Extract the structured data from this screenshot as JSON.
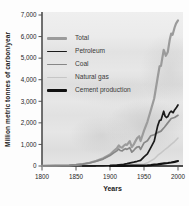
{
  "chart_data": {
    "type": "line",
    "title": "",
    "xlabel": "Years",
    "ylabel": "Million metric tonnes of carbon/year",
    "xlim": [
      1800,
      2000
    ],
    "ylim": [
      0,
      7000
    ],
    "grid": false,
    "legend_position": "top-left",
    "x_ticks": [
      {
        "value": 1800,
        "label": "1800"
      },
      {
        "value": 1850,
        "label": "1850"
      },
      {
        "value": 1900,
        "label": "1900"
      },
      {
        "value": 1950,
        "label": "1950"
      },
      {
        "value": 2000,
        "label": "2000"
      }
    ],
    "y_ticks": [
      {
        "value": 0,
        "label": "0"
      },
      {
        "value": 1000,
        "label": "1,000"
      },
      {
        "value": 2000,
        "label": "2,000"
      },
      {
        "value": 3000,
        "label": "3,000"
      },
      {
        "value": 4000,
        "label": "4,000"
      },
      {
        "value": 5000,
        "label": "5,000"
      },
      {
        "value": 6000,
        "label": "6,000"
      },
      {
        "value": 7000,
        "label": "7,000"
      }
    ],
    "series": [
      {
        "name": "Total",
        "color": "#9b9b9b",
        "width": 2.2,
        "points": [
          [
            1800,
            8
          ],
          [
            1810,
            12
          ],
          [
            1820,
            15
          ],
          [
            1830,
            25
          ],
          [
            1840,
            34
          ],
          [
            1850,
            55
          ],
          [
            1860,
            92
          ],
          [
            1870,
            148
          ],
          [
            1880,
            238
          ],
          [
            1890,
            356
          ],
          [
            1900,
            534
          ],
          [
            1905,
            680
          ],
          [
            1910,
            820
          ],
          [
            1913,
            950
          ],
          [
            1915,
            880
          ],
          [
            1918,
            850
          ],
          [
            1920,
            935
          ],
          [
            1923,
            1000
          ],
          [
            1925,
            980
          ],
          [
            1929,
            1150
          ],
          [
            1932,
            880
          ],
          [
            1935,
            1000
          ],
          [
            1937,
            1130
          ],
          [
            1940,
            1300
          ],
          [
            1943,
            1380
          ],
          [
            1945,
            1160
          ],
          [
            1950,
            1640
          ],
          [
            1955,
            2050
          ],
          [
            1960,
            2580
          ],
          [
            1965,
            3130
          ],
          [
            1970,
            4080
          ],
          [
            1973,
            4620
          ],
          [
            1975,
            4640
          ],
          [
            1979,
            5380
          ],
          [
            1980,
            5310
          ],
          [
            1982,
            5110
          ],
          [
            1985,
            5290
          ],
          [
            1988,
            5870
          ],
          [
            1990,
            6140
          ],
          [
            1992,
            6080
          ],
          [
            1995,
            6420
          ],
          [
            1997,
            6600
          ],
          [
            2000,
            6750
          ]
        ]
      },
      {
        "name": "Petroleum",
        "color": "#1a1a1a",
        "width": 1.7,
        "points": [
          [
            1860,
            1
          ],
          [
            1870,
            3
          ],
          [
            1880,
            6
          ],
          [
            1890,
            10
          ],
          [
            1900,
            16
          ],
          [
            1910,
            40
          ],
          [
            1920,
            78
          ],
          [
            1925,
            110
          ],
          [
            1930,
            150
          ],
          [
            1935,
            180
          ],
          [
            1940,
            220
          ],
          [
            1945,
            260
          ],
          [
            1950,
            425
          ],
          [
            1955,
            560
          ],
          [
            1960,
            850
          ],
          [
            1965,
            1150
          ],
          [
            1970,
            1850
          ],
          [
            1973,
            2120
          ],
          [
            1975,
            2130
          ],
          [
            1979,
            2540
          ],
          [
            1981,
            2310
          ],
          [
            1983,
            2250
          ],
          [
            1985,
            2290
          ],
          [
            1988,
            2480
          ],
          [
            1990,
            2540
          ],
          [
            1993,
            2470
          ],
          [
            1995,
            2600
          ],
          [
            1998,
            2720
          ],
          [
            2000,
            2830
          ]
        ]
      },
      {
        "name": "Coal",
        "color": "#868686",
        "width": 1.7,
        "points": [
          [
            1800,
            8
          ],
          [
            1810,
            11
          ],
          [
            1820,
            14
          ],
          [
            1830,
            24
          ],
          [
            1840,
            33
          ],
          [
            1850,
            54
          ],
          [
            1860,
            88
          ],
          [
            1870,
            140
          ],
          [
            1880,
            220
          ],
          [
            1890,
            320
          ],
          [
            1900,
            480
          ],
          [
            1905,
            600
          ],
          [
            1910,
            700
          ],
          [
            1913,
            790
          ],
          [
            1915,
            720
          ],
          [
            1918,
            700
          ],
          [
            1920,
            760
          ],
          [
            1923,
            800
          ],
          [
            1925,
            770
          ],
          [
            1929,
            850
          ],
          [
            1932,
            640
          ],
          [
            1935,
            730
          ],
          [
            1937,
            800
          ],
          [
            1940,
            880
          ],
          [
            1943,
            900
          ],
          [
            1945,
            770
          ],
          [
            1950,
            1070
          ],
          [
            1955,
            1170
          ],
          [
            1960,
            1400
          ],
          [
            1965,
            1450
          ],
          [
            1970,
            1550
          ],
          [
            1975,
            1620
          ],
          [
            1980,
            1800
          ],
          [
            1985,
            2000
          ],
          [
            1990,
            2200
          ],
          [
            1995,
            2250
          ],
          [
            2000,
            2350
          ]
        ]
      },
      {
        "name": "Natural gas",
        "color": "#c6c6c6",
        "width": 1.5,
        "points": [
          [
            1880,
            1
          ],
          [
            1890,
            3
          ],
          [
            1900,
            6
          ],
          [
            1910,
            14
          ],
          [
            1920,
            25
          ],
          [
            1930,
            50
          ],
          [
            1940,
            80
          ],
          [
            1950,
            97
          ],
          [
            1955,
            150
          ],
          [
            1960,
            235
          ],
          [
            1965,
            330
          ],
          [
            1970,
            493
          ],
          [
            1975,
            610
          ],
          [
            1980,
            740
          ],
          [
            1985,
            860
          ],
          [
            1990,
            1000
          ],
          [
            1995,
            1130
          ],
          [
            2000,
            1300
          ]
        ]
      },
      {
        "name": "Cement production",
        "color": "#111111",
        "width": 2.2,
        "points": [
          [
            1900,
            3
          ],
          [
            1910,
            6
          ],
          [
            1920,
            8
          ],
          [
            1930,
            12
          ],
          [
            1940,
            16
          ],
          [
            1950,
            18
          ],
          [
            1955,
            30
          ],
          [
            1960,
            43
          ],
          [
            1965,
            60
          ],
          [
            1970,
            78
          ],
          [
            1975,
            100
          ],
          [
            1980,
            120
          ],
          [
            1985,
            140
          ],
          [
            1990,
            160
          ],
          [
            1995,
            190
          ],
          [
            2000,
            230
          ]
        ]
      }
    ]
  }
}
